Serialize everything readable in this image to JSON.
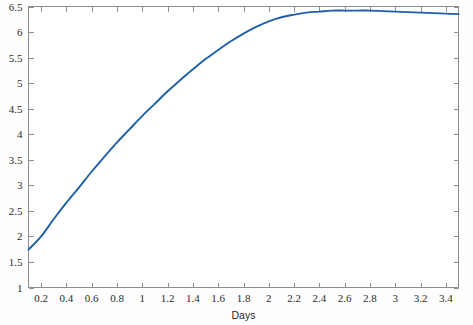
{
  "chart_data": {
    "type": "line",
    "title": "",
    "subtitle": "",
    "xlabel": "Days",
    "ylabel": "",
    "xlim": [
      0.1,
      3.5
    ],
    "ylim": [
      1,
      6.5
    ],
    "grid": false,
    "legend": null,
    "legend_position": "none",
    "xticks": [
      0.2,
      0.4,
      0.6,
      0.8,
      1,
      1.2,
      1.4,
      1.6,
      1.8,
      2,
      2.2,
      2.4,
      2.6,
      2.8,
      3,
      3.2,
      3.4
    ],
    "xticklabels": [
      "0.2",
      "0.4",
      "0.6",
      "0.8",
      "1",
      "1.2",
      "1.4",
      "1.6",
      "1.8",
      "2",
      "2.2",
      "2.4",
      "2.6",
      "2.8",
      "3",
      "3.2",
      "3.4"
    ],
    "yticks": [
      1,
      1.5,
      2,
      2.5,
      3,
      3.5,
      4,
      4.5,
      5,
      5.5,
      6,
      6.5
    ],
    "yticklabels": [
      "1",
      "1.5",
      "2",
      "2.5",
      "3",
      "3.5",
      "4",
      "4.5",
      "5",
      "5.5",
      "6",
      "6.5"
    ],
    "tick_direction": "in",
    "box": true,
    "series": [
      {
        "name": "series-1",
        "color": "#1f5fa8",
        "x": [
          0.1,
          0.2,
          0.3,
          0.4,
          0.5,
          0.6,
          0.7,
          0.8,
          0.9,
          1.0,
          1.1,
          1.2,
          1.3,
          1.4,
          1.5,
          1.6,
          1.7,
          1.8,
          1.9,
          2.0,
          2.1,
          2.2,
          2.3,
          2.4,
          2.5,
          2.6,
          2.7,
          2.8,
          2.9,
          3.0,
          3.1,
          3.2,
          3.3,
          3.4,
          3.5
        ],
        "y": [
          1.74,
          2.0,
          2.34,
          2.66,
          2.96,
          3.27,
          3.56,
          3.84,
          4.1,
          4.36,
          4.6,
          4.84,
          5.06,
          5.27,
          5.47,
          5.65,
          5.82,
          5.97,
          6.1,
          6.21,
          6.29,
          6.34,
          6.38,
          6.4,
          6.42,
          6.42,
          6.42,
          6.42,
          6.41,
          6.4,
          6.39,
          6.38,
          6.37,
          6.36,
          6.35
        ]
      }
    ]
  },
  "axes": {
    "x_axis_title": "Days"
  }
}
